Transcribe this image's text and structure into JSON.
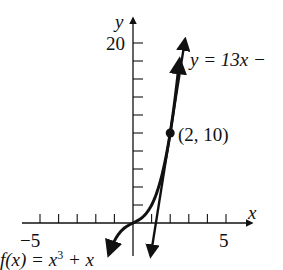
{
  "chart_data": {
    "type": "line",
    "title": "",
    "xlabel": "x",
    "ylabel": "y",
    "xlim": [
      -5.8,
      6.2
    ],
    "ylim": [
      -4.5,
      22
    ],
    "x_ticks": [
      -5,
      -4,
      -3,
      -2,
      -1,
      0,
      1,
      2,
      3,
      4,
      5
    ],
    "x_tick_labels": {
      "-5": "−5",
      "5": "5"
    },
    "y_ticks": [
      2,
      4,
      6,
      8,
      10,
      12,
      14,
      16,
      18,
      20
    ],
    "y_tick_labels": {
      "20": "20"
    },
    "grid": false,
    "series": [
      {
        "name": "f(x) = x³ + x",
        "label": "f(x) = x³ + x",
        "type": "curve",
        "function": "x^3 + x",
        "x_range": [
          -1.3,
          2.5
        ]
      },
      {
        "name": "y = 13x − 16",
        "label": "y = 13x −",
        "type": "tangent-line",
        "function": "13x - 16",
        "x_range": [
          0.95,
          2.8
        ]
      }
    ],
    "annotations": [
      {
        "type": "point",
        "x": 2,
        "y": 10,
        "label": "(2, 10)"
      }
    ]
  },
  "labels": {
    "y_axis": "y",
    "x_axis": "x",
    "y_tick_20": "20",
    "x_tick_neg5": "−5",
    "x_tick_5": "5",
    "tangent_label": "y = 13x −",
    "curve_label_prefix": "f(x) = x",
    "curve_label_exp": "3",
    "curve_label_suffix": " + x",
    "point_label": "(2, 10)"
  }
}
